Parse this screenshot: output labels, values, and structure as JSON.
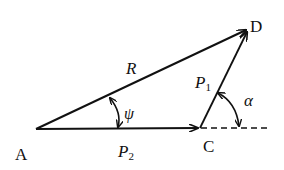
{
  "diagram": {
    "title": "",
    "points": {
      "A": {
        "label": "A",
        "x": 36,
        "y": 129
      },
      "C": {
        "label": "C",
        "x": 200,
        "y": 128
      },
      "D": {
        "label": "D",
        "x": 248,
        "y": 29
      }
    },
    "vectors": [
      {
        "id": "R",
        "label": "R",
        "from": "A",
        "to": "D"
      },
      {
        "id": "P1",
        "label": "P",
        "subscript": "1",
        "from": "C",
        "to": "D"
      },
      {
        "id": "P2",
        "label": "P",
        "subscript": "2",
        "from": "A",
        "to": "C"
      }
    ],
    "angles": [
      {
        "id": "psi",
        "label": "ψ",
        "between": [
          "R",
          "P2"
        ]
      },
      {
        "id": "alpha",
        "label": "α",
        "between": [
          "P1",
          "extension of P2"
        ]
      }
    ],
    "colors": {
      "stroke": "#111111",
      "background": "#ffffff"
    }
  }
}
